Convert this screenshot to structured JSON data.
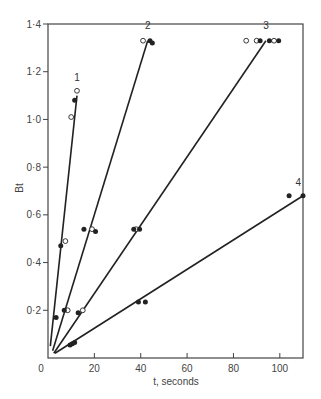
{
  "chart_data": {
    "type": "scatter",
    "title": "",
    "xlabel": "t, seconds",
    "ylabel": "Bt",
    "xlim": [
      0,
      110
    ],
    "ylim": [
      0,
      1.4
    ],
    "grid": false,
    "legend": "none (lines labelled 1-4 at their upper ends)",
    "x_ticks": [
      0,
      20,
      40,
      60,
      80,
      100
    ],
    "x_tick_labels": [
      "0",
      "20",
      "40",
      "60",
      "80",
      "100"
    ],
    "y_ticks": [
      0.2,
      0.4,
      0.6,
      0.8,
      1.0,
      1.2,
      1.4
    ],
    "y_tick_labels": [
      "0·2",
      "0·4",
      "0·6",
      "0·8",
      "1·0",
      "1·2",
      "1·4"
    ],
    "origin_label": "0",
    "series": [
      {
        "name": "1",
        "line": {
          "from": [
            1,
            0.05
          ],
          "to": [
            12.5,
            1.1
          ]
        },
        "label_pos": [
          12.5,
          1.16
        ],
        "points_filled": [
          [
            3.5,
            0.17
          ],
          [
            5.5,
            0.47
          ],
          [
            11.5,
            1.08
          ]
        ],
        "points_open": [
          [
            7.5,
            0.49
          ],
          [
            10,
            1.01
          ],
          [
            12.5,
            1.12
          ]
        ]
      },
      {
        "name": "2",
        "line": {
          "from": [
            2,
            0.03
          ],
          "to": [
            43,
            1.33
          ]
        },
        "label_pos": [
          43,
          1.38
        ],
        "points_filled": [
          [
            7,
            0.2
          ],
          [
            15.5,
            0.54
          ],
          [
            20.5,
            0.53
          ],
          [
            44,
            1.33
          ],
          [
            45,
            1.32
          ]
        ],
        "points_open": [
          [
            8.5,
            0.2
          ],
          [
            19,
            0.54
          ],
          [
            41,
            1.33
          ]
        ]
      },
      {
        "name": "3",
        "line": {
          "from": [
            2.5,
            0.02
          ],
          "to": [
            94,
            1.33
          ]
        },
        "label_pos": [
          94,
          1.38
        ],
        "points_filled": [
          [
            13,
            0.19
          ],
          [
            37,
            0.54
          ],
          [
            39.5,
            0.54
          ],
          [
            91.5,
            1.33
          ],
          [
            95.5,
            1.33
          ],
          [
            99.5,
            1.33
          ]
        ],
        "points_open": [
          [
            15,
            0.2
          ],
          [
            38,
            0.54
          ],
          [
            85.5,
            1.33
          ],
          [
            90,
            1.33
          ],
          [
            97.5,
            1.33
          ]
        ]
      },
      {
        "name": "4",
        "line": {
          "from": [
            3,
            0.02
          ],
          "to": [
            110,
            0.68
          ]
        },
        "label_pos": [
          108,
          0.72
        ],
        "points_filled": [
          [
            9.5,
            0.055
          ],
          [
            10.5,
            0.06
          ],
          [
            11.5,
            0.065
          ],
          [
            39,
            0.235
          ],
          [
            42,
            0.235
          ],
          [
            104,
            0.68
          ],
          [
            110,
            0.68
          ]
        ],
        "points_open": []
      }
    ]
  },
  "colors": {
    "ink": "#222222",
    "axis": "#444444",
    "background": "#ffffff"
  }
}
